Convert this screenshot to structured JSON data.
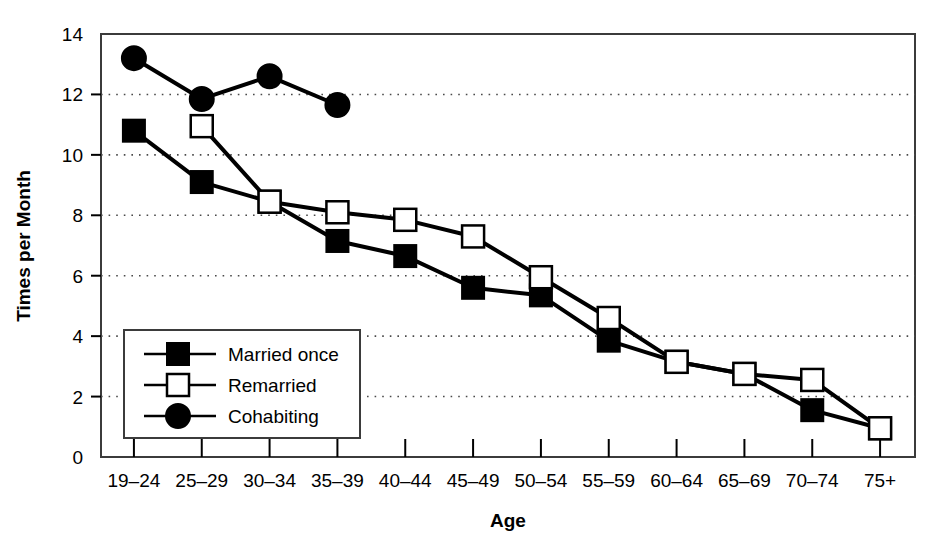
{
  "chart_data": {
    "type": "line",
    "title": "",
    "xlabel": "Age",
    "ylabel": "Times per Month",
    "categories": [
      "19–24",
      "25–29",
      "30–34",
      "35–39",
      "40–44",
      "45–49",
      "50–54",
      "55–59",
      "60–64",
      "65–69",
      "70–74",
      "75+"
    ],
    "ylim": [
      0,
      14
    ],
    "yticks": [
      0,
      2,
      4,
      6,
      8,
      10,
      12,
      14
    ],
    "ytick_labels": [
      "0",
      "2",
      "4",
      "6",
      "8",
      "10",
      "12",
      "14"
    ],
    "grid": "horizontal-dotted",
    "legend_position": "lower-left-inside",
    "series": [
      {
        "name": "Married once",
        "marker": "filled-square",
        "color": "#000000",
        "values": [
          10.8,
          9.1,
          8.45,
          7.15,
          6.65,
          5.6,
          5.35,
          3.85,
          3.15,
          2.75,
          1.55,
          0.95
        ]
      },
      {
        "name": "Remarried",
        "marker": "open-square",
        "color": "#000000",
        "values": [
          null,
          10.95,
          8.45,
          8.1,
          7.85,
          7.3,
          5.95,
          4.6,
          3.15,
          2.75,
          2.55,
          0.95
        ]
      },
      {
        "name": "Cohabiting",
        "marker": "filled-circle",
        "color": "#000000",
        "values": [
          13.2,
          11.85,
          12.6,
          11.65,
          null,
          null,
          null,
          null,
          null,
          null,
          null,
          null
        ]
      }
    ]
  },
  "axes": {
    "x_title": "Age",
    "y_title": "Times per Month"
  },
  "legend": {
    "items": [
      {
        "label": "Married once",
        "marker": "filled-square"
      },
      {
        "label": "Remarried",
        "marker": "open-square"
      },
      {
        "label": "Cohabiting",
        "marker": "filled-circle"
      }
    ]
  },
  "colors": {
    "ink": "#000000",
    "frame": "#3b3b3b",
    "grid": "#4a4a4a",
    "background": "#ffffff"
  }
}
